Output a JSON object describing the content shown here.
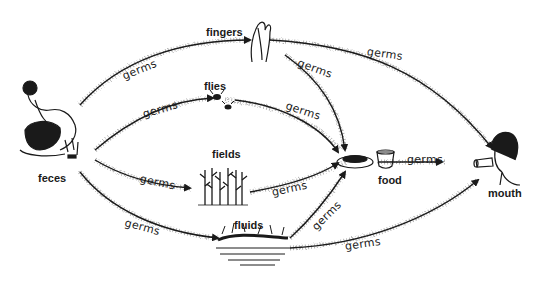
{
  "diagram": {
    "type": "transmission-flow",
    "nodes": {
      "feces": "feces",
      "fingers": "fingers",
      "flies": "flies",
      "fields": "fields",
      "fluids": "fluids",
      "food": "food",
      "mouth": "mouth"
    },
    "edge_label": "germs",
    "edges": [
      {
        "from": "feces",
        "to": "fingers",
        "label": "germs"
      },
      {
        "from": "feces",
        "to": "flies",
        "label": "germs"
      },
      {
        "from": "feces",
        "to": "fields",
        "label": "germs"
      },
      {
        "from": "feces",
        "to": "fluids",
        "label": "germs"
      },
      {
        "from": "fingers",
        "to": "mouth",
        "label": "germs"
      },
      {
        "from": "fingers",
        "to": "food",
        "label": "germs"
      },
      {
        "from": "flies",
        "to": "food",
        "label": "germs"
      },
      {
        "from": "fields",
        "to": "food",
        "label": "germs"
      },
      {
        "from": "fluids",
        "to": "food",
        "label": "germs"
      },
      {
        "from": "fluids",
        "to": "mouth",
        "label": "germs"
      },
      {
        "from": "food",
        "to": "mouth",
        "label": "germs"
      }
    ],
    "colors": {
      "ink": "#1a1a1a",
      "stipple": "#555555",
      "background": "#ffffff"
    }
  }
}
